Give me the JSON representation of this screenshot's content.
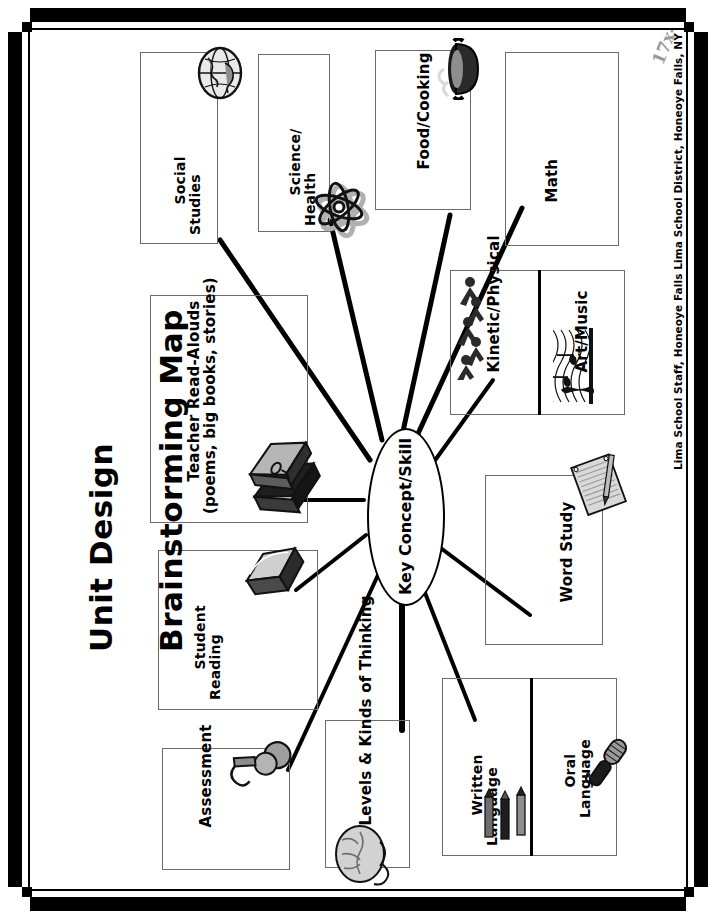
{
  "document": {
    "title_line1": "Unit Design",
    "title_line2": "Brainstorming Map",
    "credit": "Lima School Staff, Honeoye Falls Lima School District, Honeoye Falls, NY"
  },
  "center": {
    "label": "Key Concept/Skill"
  },
  "nodes": [
    {
      "id": "social-studies",
      "label_line1": "Social",
      "label_line2": "Studies",
      "icon": "globe-icon"
    },
    {
      "id": "science-health",
      "label_line1": "Science/",
      "label_line2": "Health",
      "icon": "atom-icon"
    },
    {
      "id": "food-cooking",
      "label_line1": "Food/Cooking",
      "label_line2": "",
      "icon": "cooking-pot-icon"
    },
    {
      "id": "math",
      "label_line1": "Math",
      "label_line2": "",
      "icon": "math-formula-icon"
    },
    {
      "id": "kinetic-physical",
      "label_line1": "Kinetic/Physical",
      "label_line2": "",
      "icon": "people-running-icon"
    },
    {
      "id": "art-music",
      "label_line1": "Art/Music",
      "label_line2": "",
      "icon": "music-staff-icon"
    },
    {
      "id": "word-study",
      "label_line1": "Word Study",
      "label_line2": "",
      "icon": "notepad-pencil-icon"
    },
    {
      "id": "oral-language",
      "label_line1": "Oral",
      "label_line2": "Language",
      "icon": "microphone-icon"
    },
    {
      "id": "written-language",
      "label_line1": "Written",
      "label_line2": "Language",
      "icon": "pencils-icon"
    },
    {
      "id": "levels-thinking",
      "label_line1": "Levels & Kinds of Thinking",
      "label_line2": "",
      "icon": "brain-icon"
    },
    {
      "id": "assessment",
      "label_line1": "Assessment",
      "label_line2": "",
      "icon": "magnifier-icon"
    },
    {
      "id": "student-reading",
      "label_line1": "Student",
      "label_line2": "Reading",
      "icon": "open-book-icon"
    },
    {
      "id": "teacher-readalouds",
      "label_line1": "Teacher Read-Alouds",
      "label_line2": "(poems, big books, stories)",
      "icon": "stacked-books-icon"
    }
  ],
  "math_icon": {
    "line1": "y=f(x)",
    "line2": "17x-39=v"
  },
  "colors": {
    "frame": "#000000",
    "box_border": "#6b6b6b",
    "connector": "#000000",
    "paper": "#ffffff",
    "formula_gray": "#9a9a9a"
  }
}
